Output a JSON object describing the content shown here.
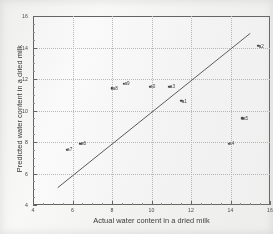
{
  "chart_data": {
    "type": "scatter",
    "title": "",
    "xlabel": "Actual water content in a dried milk",
    "ylabel": "Predicted water content in a dried milk",
    "xlim": [
      4,
      16
    ],
    "ylim": [
      4,
      16
    ],
    "xticks": [
      4,
      6,
      8,
      10,
      12,
      14,
      16
    ],
    "xticklabels": [
      "4",
      "6",
      "8",
      "10",
      "12",
      "14",
      "16"
    ],
    "yticks": [
      4,
      6,
      8,
      10,
      12,
      14,
      16
    ],
    "yticklabels": [
      "4",
      "6",
      "8",
      "10",
      "12",
      "14",
      "16"
    ],
    "grid": true,
    "legend": null,
    "points": [
      {
        "label": "a7",
        "x": 5.7,
        "y": 7.5
      },
      {
        "label": "a6",
        "x": 6.4,
        "y": 7.9
      },
      {
        "label": "a8",
        "x": 8.0,
        "y": 11.4
      },
      {
        "label": "a9",
        "x": 8.6,
        "y": 11.7
      },
      {
        "label": "a0",
        "x": 9.9,
        "y": 11.5
      },
      {
        "label": "a3",
        "x": 10.9,
        "y": 11.5
      },
      {
        "label": "a1",
        "x": 11.5,
        "y": 10.6
      },
      {
        "label": "a5",
        "x": 14.6,
        "y": 9.5
      },
      {
        "label": "a4",
        "x": 13.9,
        "y": 7.9
      },
      {
        "label": "a2",
        "x": 15.4,
        "y": 14.1
      }
    ],
    "line": {
      "name": "fit-line",
      "x0": 5.25,
      "y0": 5.1,
      "x1": 15.0,
      "y1": 14.9
    }
  }
}
